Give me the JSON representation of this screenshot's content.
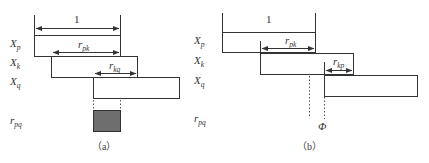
{
  "diagram": {
    "colors": {
      "stroke": "#333333",
      "fill_rpq": "#6e6e6e",
      "background": "#ffffff"
    },
    "panel_a": {
      "caption": "（a）",
      "row_labels": [
        {
          "main": "X",
          "sub": "p"
        },
        {
          "main": "X",
          "sub": "k"
        },
        {
          "main": "X",
          "sub": "q"
        },
        {
          "main": "r",
          "sub": "pq"
        }
      ],
      "unit_label": "1",
      "arrow_rpk": {
        "main": "r",
        "sub": "pk"
      },
      "arrow_rkq": {
        "main": "r",
        "sub": "kq"
      }
    },
    "panel_b": {
      "caption": "（b）",
      "row_labels": [
        {
          "main": "X",
          "sub": "p"
        },
        {
          "main": "X",
          "sub": "k"
        },
        {
          "main": "X",
          "sub": "q"
        },
        {
          "main": "r",
          "sub": "pq"
        }
      ],
      "unit_label": "1",
      "arrow_rpk": {
        "main": "r",
        "sub": "pk"
      },
      "arrow_rkp": {
        "main": "r",
        "sub": "kp"
      },
      "empty_result": "Φ"
    }
  }
}
